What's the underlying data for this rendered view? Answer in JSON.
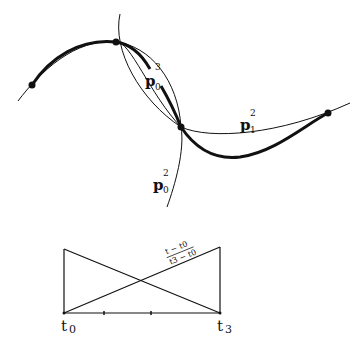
{
  "diagram": {
    "curve_labels": {
      "p03": {
        "base": "p",
        "sub": "0",
        "sup": "3"
      },
      "p12": {
        "base": "p",
        "sub": "1",
        "sup": "2"
      },
      "p02": {
        "base": "p",
        "sub": "0",
        "sup": "2"
      }
    },
    "control_points": [
      {
        "x": 32,
        "y": 85
      },
      {
        "x": 116,
        "y": 42
      },
      {
        "x": 181,
        "y": 127
      },
      {
        "x": 328,
        "y": 113
      }
    ],
    "blend_chart": {
      "left_label": {
        "base": "t",
        "sub": "0"
      },
      "right_label": {
        "base": "t",
        "sub": "3"
      },
      "fraction_numerator": "t − t0",
      "fraction_denominator": "t3 − t0"
    },
    "colors": {
      "ink": "#111111",
      "background": "#ffffff"
    }
  }
}
